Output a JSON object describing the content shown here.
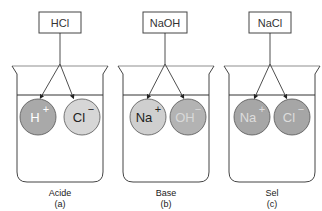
{
  "panels": [
    {
      "compound": "HCl",
      "ion1": {
        "label": "H",
        "charge": "+",
        "fill": "#a9a9a9",
        "text_color": "#ffffff"
      },
      "ion2": {
        "label": "Cl",
        "charge": "−",
        "fill": "#d6d6d6",
        "text_color": "#222222"
      },
      "caption": "Acide",
      "letter": "(a)"
    },
    {
      "compound": "NaOH",
      "ion1": {
        "label": "Na",
        "charge": "+",
        "fill": "#cfcfcf",
        "text_color": "#222222"
      },
      "ion2": {
        "label": "OH",
        "charge": "−",
        "fill": "#b3b3b3",
        "text_color": "#d9d9d9"
      },
      "caption": "Base",
      "letter": "(b)"
    },
    {
      "compound": "NaCl",
      "ion1": {
        "label": "Na",
        "charge": "+",
        "fill": "#a6a6a6",
        "text_color": "#dddddd"
      },
      "ion2": {
        "label": "Cl",
        "charge": "−",
        "fill": "#a6a6a6",
        "text_color": "#dddddd"
      },
      "caption": "Sel",
      "letter": "(c)"
    }
  ]
}
